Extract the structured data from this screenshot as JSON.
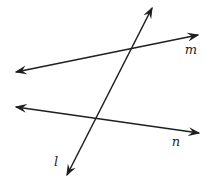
{
  "diagram": {
    "width": 220,
    "height": 187,
    "background_color": "#ffffff",
    "line_color": "#1f1f1f",
    "label_color": "#1f1f1f",
    "stroke_width": 1.5,
    "lines": [
      {
        "id": "m",
        "label": "m",
        "x1": 16,
        "y1": 72,
        "x2": 198,
        "y2": 35,
        "label_x": 191,
        "label_y": 54,
        "arrow_start": true,
        "arrow_end": true
      },
      {
        "id": "n",
        "label": "n",
        "x1": 16,
        "y1": 107,
        "x2": 199,
        "y2": 133,
        "label_x": 176,
        "label_y": 146,
        "arrow_start": true,
        "arrow_end": true
      },
      {
        "id": "l",
        "label": "l",
        "x1": 152,
        "y1": 8,
        "x2": 67,
        "y2": 175,
        "label_x": 56,
        "label_y": 166,
        "arrow_start": true,
        "arrow_end": true
      }
    ]
  }
}
